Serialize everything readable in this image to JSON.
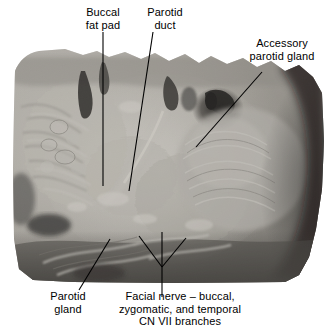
{
  "figure": {
    "kind": "anatomical-dissection-photograph",
    "region": "lateral face / parotid region",
    "background_color": "#ffffff",
    "label_color": "#000000",
    "leader_color": "#000000",
    "photo_tone": "grayscale"
  },
  "labels": {
    "buccal_fat_pad": "Buccal\nfat pad",
    "parotid_duct": "Parotid\nduct",
    "accessory_parotid_gland": "Accessory\nparotid gland",
    "parotid_gland": "Parotid\ngland",
    "facial_nerve": "Facial nerve – buccal,\nzygomatic, and temporal\nCN VII branches"
  },
  "photo": {
    "alt": "Grayscale cadaveric dissection of the lateral face showing the parotid gland, parotid duct, buccal fat pad, accessory parotid gland and branches of the facial nerve"
  }
}
